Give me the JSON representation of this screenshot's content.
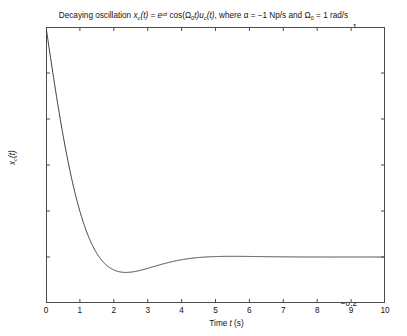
{
  "figure": {
    "background_color": "#ffffff",
    "axis_color": "#4d4d4d",
    "curve_color": "#3c3c3c"
  },
  "title": {
    "prefix": "Decaying oscillation ",
    "x_var": "x",
    "x_sub": "c",
    "arg_t": "(t)",
    "equals": " = ",
    "exp_base": "e",
    "exp_sup": "αt",
    "cos_open": " cos(",
    "omega": "Ω",
    "omega_sub": "0",
    "cos_close": "t)",
    "u_var": "u",
    "u_sub": "c",
    "u_arg": "(t)",
    "where": ", where ",
    "alpha": "α",
    "alpha_value": " = −1 Np/s and ",
    "omega2": "Ω",
    "omega2_sub": "0",
    "omega_value": " = 1 rad/s",
    "full_text": "Decaying oscillation x_c(t) = e^(αt) cos(Ω_0 t) u_c(t), where α = −1 Np/s and Ω_0 = 1 rad/s"
  },
  "axes": {
    "xlabel_prefix": "Time ",
    "xlabel_var": "t",
    "xlabel_suffix": " (s)",
    "ylabel_var": "x",
    "ylabel_sub": "c",
    "ylabel_arg": "(t)",
    "x_ticks": [
      "0",
      "1",
      "2",
      "3",
      "4",
      "5",
      "6",
      "7",
      "8",
      "9",
      "10"
    ],
    "y_ticks": [
      "1",
      "0.8",
      "0.6",
      "0.4",
      "0.2",
      "0",
      "−0.2"
    ]
  },
  "chart_data": {
    "type": "line",
    "xlabel": "Time t (s)",
    "ylabel": "x_c(t)",
    "xlim": [
      0,
      10
    ],
    "ylim": [
      -0.2,
      1.0
    ],
    "xticks": [
      0,
      1,
      2,
      3,
      4,
      5,
      6,
      7,
      8,
      9,
      10
    ],
    "yticks": [
      -0.2,
      0,
      0.2,
      0.4,
      0.6,
      0.8,
      1.0
    ],
    "grid": false,
    "legend": null,
    "series": [
      {
        "name": "x_c(t) = e^(-t)cos(t)u_c(t)",
        "color": "#3c3c3c",
        "linewidth": 1,
        "formula": "exp(-1*t)*cos(1*t)",
        "alpha_np_per_s": -1,
        "omega0_rad_per_s": 1,
        "x": [
          0,
          0.1,
          0.2,
          0.3,
          0.4,
          0.5,
          0.6,
          0.7,
          0.8,
          0.9,
          1.0,
          1.2,
          1.4,
          1.5708,
          1.8,
          2.0,
          2.2,
          2.4,
          2.6,
          2.8,
          3.0,
          3.5,
          4.0,
          4.5,
          4.712,
          5.0,
          5.5,
          6.0,
          6.5,
          7.0,
          7.5,
          7.854,
          8.0,
          8.5,
          9.0,
          9.5,
          10.0
        ],
        "y": [
          1.0,
          0.9003,
          0.8024,
          0.7078,
          0.6174,
          0.5323,
          0.453,
          0.3798,
          0.3131,
          0.2527,
          0.1988,
          0.1091,
          0.0416,
          0.0,
          -0.0376,
          -0.0563,
          -0.0652,
          -0.0667,
          -0.0636,
          -0.0573,
          -0.0493,
          -0.0283,
          -0.012,
          -0.0023,
          0.0,
          0.0019,
          0.0029,
          0.0024,
          0.0015,
          0.0007,
          0.0002,
          0.0,
          -0.0001,
          -0.0002,
          -0.0001,
          -6e-05,
          -2e-05
        ],
        "key_points": {
          "initial_value": 1.0,
          "zero_crossing_t": 1.5708,
          "minimum_t": 2.4,
          "minimum_value": -0.0667,
          "final_value": 0.0
        }
      }
    ]
  }
}
